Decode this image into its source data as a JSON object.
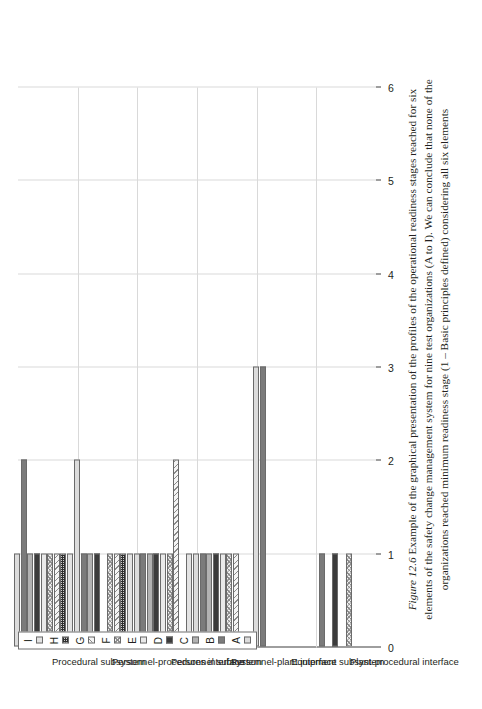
{
  "figure": {
    "caption_label": "Figure 12.6",
    "caption_text": "Example of the graphical presentation of the profiles of the operational readiness stages reached for six elements of the safety change management system for nine test organizations (A to I). We can conclude that none of the organizations reached minimum readiness stage (1 – Basic principles defined) considering all six elements"
  },
  "chart_data": {
    "type": "bar",
    "orientation": "vertical-grouped",
    "title": "",
    "xlabel": "Elements of the operational readiness (maturity)",
    "ylabel": "Readiness stage reached",
    "ylim": [
      0,
      6
    ],
    "yticks": [
      0,
      1,
      2,
      3,
      4,
      5,
      6
    ],
    "grid": true,
    "legend_position": "top-left",
    "categories": [
      "Procedural subsystem",
      "Personnel-procedures interface",
      "Personnel subsystem",
      "Personnel-plant interface",
      "Equipment subsystem",
      "Plant-procedural interface"
    ],
    "series": [
      {
        "name": "A",
        "color": "#dcdcdc",
        "pattern": "solid-light",
        "values": [
          1,
          2,
          1,
          1,
          3,
          0
        ]
      },
      {
        "name": "B",
        "color": "#7b7b7b",
        "pattern": "solid-dark-gray",
        "values": [
          2,
          1,
          1,
          1,
          3,
          1
        ]
      },
      {
        "name": "C",
        "color": "#b2b2b2",
        "pattern": "solid-mid-gray",
        "values": [
          1,
          1,
          1,
          1,
          0,
          0
        ]
      },
      {
        "name": "D",
        "color": "#3c3c3c",
        "pattern": "solid-near-black",
        "values": [
          1,
          1,
          1,
          1,
          0,
          1
        ]
      },
      {
        "name": "E",
        "color": "#e9e9e9",
        "pattern": "solid-very-light",
        "values": [
          1,
          0,
          1,
          1,
          0,
          0
        ]
      },
      {
        "name": "F",
        "color": "#f2f2f2",
        "pattern": "cross-hatch-diagonal",
        "values": [
          1,
          1,
          1,
          1,
          0,
          1
        ]
      },
      {
        "name": "G",
        "color": "#f4f4f4",
        "pattern": "diagonal-hatch",
        "values": [
          1,
          1,
          2,
          1,
          0,
          0
        ]
      },
      {
        "name": "H",
        "color": "#cfcfcf",
        "pattern": "fine-grid",
        "values": [
          1,
          1,
          0,
          0,
          0,
          0
        ]
      },
      {
        "name": "I",
        "color": "#e3e3e3",
        "pattern": "solid-light-gray",
        "values": [
          1,
          1,
          1,
          0,
          0,
          0
        ]
      }
    ]
  },
  "legend": {
    "items": [
      {
        "label": "A"
      },
      {
        "label": "B"
      },
      {
        "label": "C"
      },
      {
        "label": "D"
      },
      {
        "label": "E"
      },
      {
        "label": "F"
      },
      {
        "label": "G"
      },
      {
        "label": "H"
      },
      {
        "label": "I"
      }
    ]
  }
}
